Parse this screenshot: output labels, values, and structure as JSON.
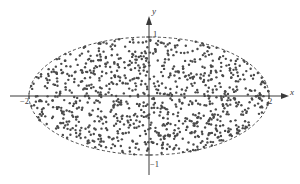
{
  "figure": {
    "background_color": "#ffffff",
    "ink_color": "#3a3a3a",
    "point_color": "#4a4a4a"
  },
  "axes": {
    "x_axis_label": "x",
    "y_axis_label": "y",
    "x_ticks": [
      {
        "label": "−2",
        "value": -2
      },
      {
        "label": "2",
        "value": 2
      }
    ],
    "y_ticks": [
      {
        "label": "1",
        "value": 1
      },
      {
        "label": "−1",
        "value": -1
      }
    ]
  },
  "chart_data": {
    "type": "scatter",
    "title": "",
    "subtitle": "",
    "xlabel": "x",
    "ylabel": "y",
    "xlim": [
      -2.4,
      2.4
    ],
    "ylim": [
      -1.35,
      1.35
    ],
    "xticks": [
      -2,
      2
    ],
    "xticklabels": [
      "−2",
      "2"
    ],
    "yticks": [
      -1,
      1
    ],
    "yticklabels": [
      "−1",
      "1"
    ],
    "grid": false,
    "legend": null,
    "annotations": [
      {
        "kind": "ellipse-boundary",
        "style": "dashed",
        "center": [
          0,
          0
        ],
        "semi_axis_x": 2,
        "semi_axis_y": 1,
        "equation": "x^2/4 + y^2 = 1"
      }
    ],
    "series": [
      {
        "name": "uniform random points in ellipse",
        "marker": "dot",
        "marker_size": 1.2,
        "color": "#4a4a4a",
        "n_points": 1000,
        "distribution": "uniform over interior of ellipse x^2/4 + y^2 <= 1",
        "region": {
          "shape": "ellipse",
          "center": [
            0,
            0
          ],
          "semi_axis_x": 2,
          "semi_axis_y": 1
        },
        "seed": 20240117
      }
    ]
  }
}
